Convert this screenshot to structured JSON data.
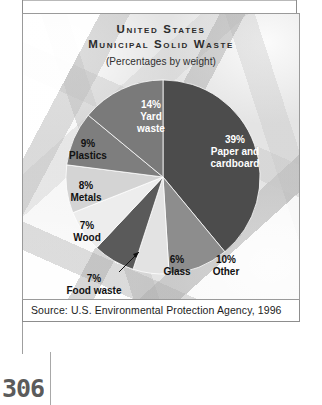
{
  "figure": {
    "title_line1": "United States",
    "title_line2": "Municipal Solid Waste",
    "subtitle": "(Percentages by weight)",
    "source": "Source: U.S. Environmental Protection Agency, 1996",
    "page_number": "306"
  },
  "chart_data": {
    "type": "pie",
    "title": "United States Municipal Solid Waste",
    "subtitle": "(Percentages by weight)",
    "unit": "percent by weight",
    "total": 100,
    "categories": [
      "Paper and cardboard",
      "Yard waste",
      "Other",
      "Plastics",
      "Metals",
      "Wood",
      "Food waste",
      "Glass"
    ],
    "values": [
      39,
      14,
      10,
      9,
      8,
      7,
      7,
      6
    ],
    "colors": [
      "#4c4c4c",
      "#7a7a7a",
      "#8d8d8d",
      "#7e7e7e",
      "#d4d4d4",
      "#ededed",
      "#5a5a5a",
      "#e3e3e3"
    ],
    "slices": [
      {
        "label": "Paper and cardboard",
        "percent": 39,
        "pct_text": "39%",
        "name_line1": "Paper and",
        "name_line2": "cardboard",
        "color": "#4c4c4c",
        "label_color": "#ffffff",
        "start_deg": 0,
        "end_deg": 140.4
      },
      {
        "label": "Other",
        "percent": 10,
        "pct_text": "10%",
        "name_line1": "Other",
        "name_line2": "",
        "color": "#8d8d8d",
        "label_color": "#111111",
        "start_deg": 140.4,
        "end_deg": 176.4
      },
      {
        "label": "Glass",
        "percent": 6,
        "pct_text": "6%",
        "name_line1": "Glass",
        "name_line2": "",
        "color": "#e3e3e3",
        "label_color": "#111111",
        "start_deg": 176.4,
        "end_deg": 198.0
      },
      {
        "label": "Food waste",
        "percent": 7,
        "pct_text": "7%",
        "name_line1": "Food waste",
        "name_line2": "",
        "color": "#5a5a5a",
        "label_color": "#111111",
        "start_deg": 198.0,
        "end_deg": 223.2
      },
      {
        "label": "Wood",
        "percent": 7,
        "pct_text": "7%",
        "name_line1": "Wood",
        "name_line2": "",
        "color": "#ededed",
        "label_color": "#111111",
        "start_deg": 223.2,
        "end_deg": 248.4
      },
      {
        "label": "Metals",
        "percent": 8,
        "pct_text": "8%",
        "name_line1": "Metals",
        "name_line2": "",
        "color": "#d4d4d4",
        "label_color": "#111111",
        "start_deg": 248.4,
        "end_deg": 277.2
      },
      {
        "label": "Plastics",
        "percent": 9,
        "pct_text": "9%",
        "name_line1": "Plastics",
        "name_line2": "",
        "color": "#7e7e7e",
        "label_color": "#111111",
        "start_deg": 277.2,
        "end_deg": 309.6
      },
      {
        "label": "Yard waste",
        "percent": 14,
        "pct_text": "14%",
        "name_line1": "Yard",
        "name_line2": "waste",
        "color": "#7a7a7a",
        "label_color": "#ffffff",
        "start_deg": 309.6,
        "end_deg": 360.0
      }
    ],
    "legend": "none (labels placed on/around slices)",
    "grid": false
  }
}
